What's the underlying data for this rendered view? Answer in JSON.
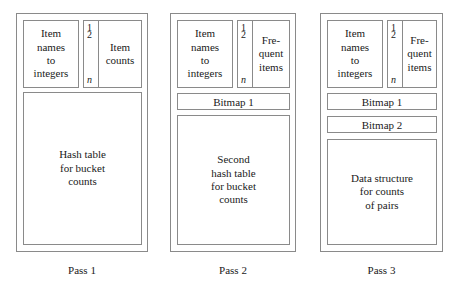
{
  "diagram": {
    "index_strip": {
      "first": "1",
      "second": "2",
      "last": "n"
    },
    "passes": [
      {
        "id": "pass-1",
        "caption": "Pass 1",
        "name_table_label": [
          "Item",
          "names",
          "to",
          "integers"
        ],
        "counts_label": [
          "Item",
          "counts"
        ],
        "bitmaps": [],
        "main_block_label": [
          "Hash table",
          "for bucket",
          "counts"
        ]
      },
      {
        "id": "pass-2",
        "caption": "Pass 2",
        "name_table_label": [
          "Item",
          "names",
          "to",
          "integers"
        ],
        "counts_label": [
          "Fre-",
          "quent",
          "items"
        ],
        "bitmaps": [
          "Bitmap 1"
        ],
        "main_block_label": [
          "Second",
          "hash table",
          "for bucket",
          "counts"
        ]
      },
      {
        "id": "pass-3",
        "caption": "Pass 3",
        "name_table_label": [
          "Item",
          "names",
          "to",
          "integers"
        ],
        "counts_label": [
          "Fre-",
          "quent",
          "items"
        ],
        "bitmaps": [
          "Bitmap 1",
          "Bitmap 2"
        ],
        "main_block_label": [
          "Data structure",
          "for counts",
          "of pairs"
        ]
      }
    ],
    "colors": {
      "background": "#ffffff",
      "border": "#8a8a8a",
      "text": "#1a1a1a"
    }
  }
}
